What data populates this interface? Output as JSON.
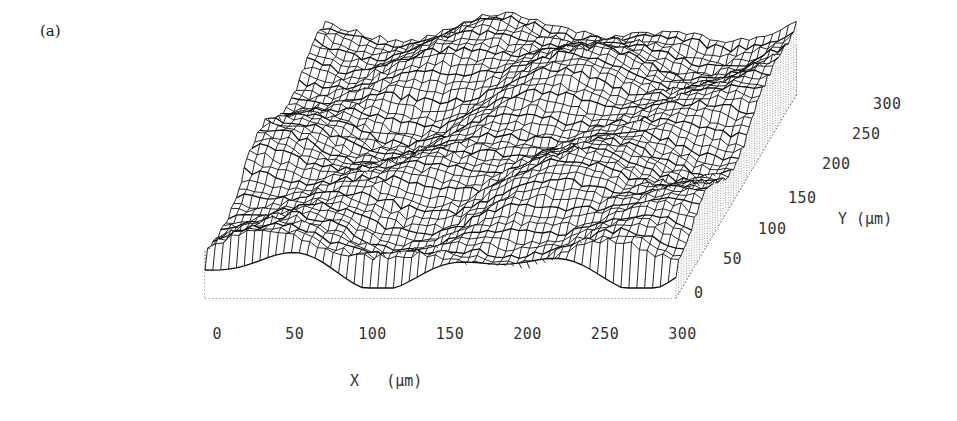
{
  "panel_label": "(a)",
  "chart_data": {
    "type": "surface",
    "title": "",
    "panel": "(a)",
    "xlabel": "X (µm)",
    "ylabel": "Y (µm)",
    "zlabel": "",
    "x_ticks": [
      "0",
      "50",
      "100",
      "150",
      "200",
      "250",
      "300"
    ],
    "y_ticks": [
      "0",
      "50",
      "100",
      "150",
      "200",
      "250",
      "300"
    ],
    "xlim": [
      0,
      300
    ],
    "ylim": [
      0,
      300
    ],
    "grid": false,
    "legend": null,
    "style": "black wireframe mesh, 3D perspective, dotted base box"
  },
  "labels": {
    "x_axis": "X",
    "x_unit": "(µm)",
    "y_axis": "Y",
    "y_unit": "(µm)"
  },
  "colors": {
    "mesh": "#111111",
    "box": "#555555",
    "text": "#333333"
  }
}
